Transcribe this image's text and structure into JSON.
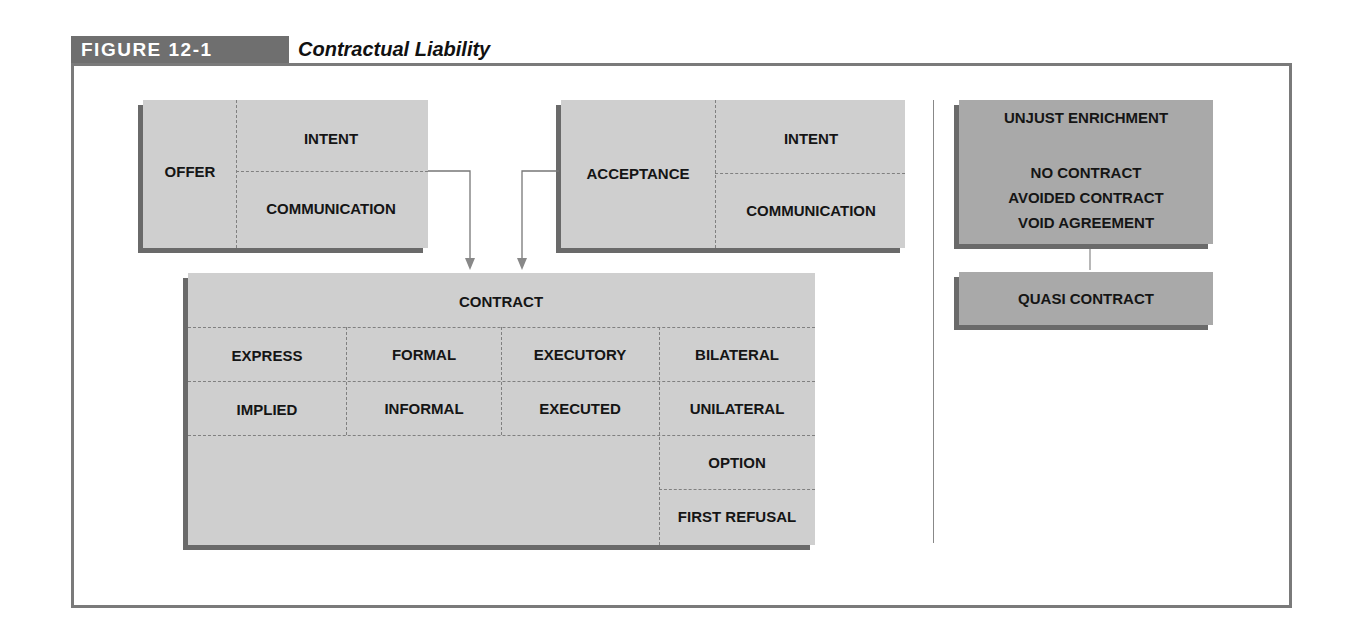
{
  "figure": {
    "number_label": "FIGURE 12-1",
    "title": "Contractual Liability"
  },
  "offer_box": {
    "label": "OFFER",
    "cells": [
      "INTENT",
      "COMMUNICATION"
    ]
  },
  "acceptance_box": {
    "label": "ACCEPTANCE",
    "cells": [
      "INTENT",
      "COMMUNICATION"
    ]
  },
  "contract_box": {
    "header": "CONTRACT",
    "rows": [
      [
        "EXPRESS",
        "FORMAL",
        "EXECUTORY",
        "BILATERAL"
      ],
      [
        "IMPLIED",
        "INFORMAL",
        "EXECUTED",
        "UNILATERAL"
      ],
      [
        "",
        "",
        "",
        "OPTION"
      ],
      [
        "",
        "",
        "",
        "FIRST REFUSAL"
      ]
    ]
  },
  "unjust_enrichment_box": {
    "title": "UNJUST ENRICHMENT",
    "items": [
      "NO CONTRACT",
      "AVOIDED CONTRACT",
      "VOID AGREEMENT"
    ]
  },
  "quasi_contract_box": {
    "label": "QUASI CONTRACT"
  },
  "colors": {
    "box_fill": "#cfcfcf",
    "box_fill_dark": "#a9a9a9",
    "shadow": "#6a6a6a",
    "label_bg": "#6f6f6f",
    "frame": "#7a7a7a"
  }
}
